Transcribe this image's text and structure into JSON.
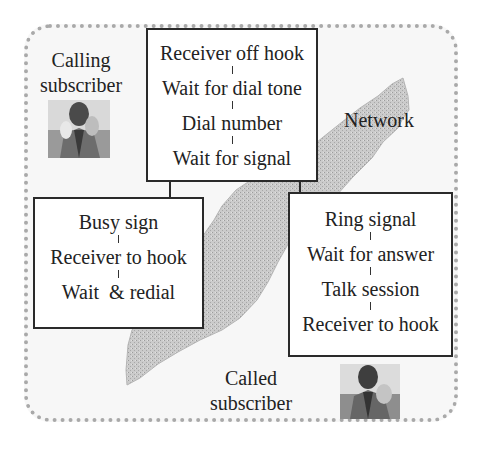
{
  "diagram": {
    "labels": {
      "calling_line1": "Calling",
      "calling_line2": "subscriber",
      "network": "Network",
      "called_line1": "Called",
      "called_line2": "subscriber"
    },
    "top_box": {
      "steps": [
        "Receiver off hook",
        "Wait for dial tone",
        "Dial number",
        "Wait for signal"
      ]
    },
    "left_box": {
      "steps": [
        "Busy sign",
        "Receiver to hook",
        "Wait  & redial"
      ]
    },
    "right_box": {
      "steps": [
        "Ring signal",
        "Wait for answer",
        "Talk session",
        "Receiver to hook"
      ]
    },
    "icons": {
      "calling_photo": "person-on-phone-photo",
      "called_photo": "person-on-phone-photo"
    },
    "colors": {
      "frame_border": "#a9a9a9",
      "background": "#f7f7f7",
      "network_fill": "#c9c9c9",
      "box_border": "#2a2a2a"
    }
  }
}
